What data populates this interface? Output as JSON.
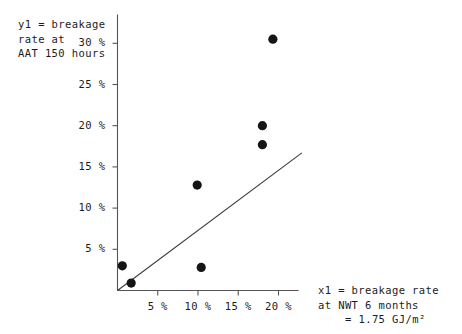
{
  "chart_data": {
    "type": "scatter",
    "title": "",
    "ylabel": "y1 = breakage rate at AAT 150 hours",
    "xlabel": "x1 = breakage rate at NWT 6 months = 1.75 GJ/m²",
    "xlim": [
      0,
      22.5
    ],
    "ylim": [
      0,
      33.5
    ],
    "grid": false,
    "legend": null,
    "x_tick_values": [
      5,
      10,
      15,
      20
    ],
    "y_tick_values": [
      5,
      10,
      15,
      20,
      25,
      30
    ],
    "x_tick_labels": [
      "5 %",
      "10 %",
      "15 %",
      "20 %"
    ],
    "y_tick_labels": [
      "5 %",
      "10 %",
      "15 %",
      "20 %",
      "25 %",
      "30 %"
    ],
    "points": [
      {
        "x": 0.6,
        "y": 3.0
      },
      {
        "x": 1.7,
        "y": 0.9
      },
      {
        "x": 9.9,
        "y": 12.8
      },
      {
        "x": 10.4,
        "y": 2.8
      },
      {
        "x": 18.0,
        "y": 20.0
      },
      {
        "x": 18.0,
        "y": 17.7
      },
      {
        "x": 19.3,
        "y": 30.5
      }
    ],
    "trend_line": {
      "x_start": 0,
      "y_start": 0,
      "x_end": 22.9,
      "y_end": 16.7
    },
    "marker_color": "#151515",
    "line_color": "#3c3c3c",
    "axis_color": "#555555"
  },
  "annotations": {
    "y_axis_label_lines": [
      "y1 = breakage",
      "rate at",
      "AAT 150 hours"
    ],
    "x_axis_label_lines": [
      "x1 = breakage rate",
      "at NWT 6 months"
    ],
    "x_axis_label_line3": "= 1.75 GJ/m²"
  }
}
